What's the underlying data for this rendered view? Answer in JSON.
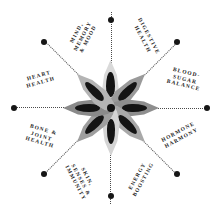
{
  "graphic": {
    "type": "radial-benefit-wheel",
    "title_visible": false,
    "background_color": "#ffffff",
    "center_motif": {
      "name": "eight-petal-flower",
      "petal_count": 8,
      "core_color": "#101010",
      "inner_marking_color": "#141414",
      "petal_colors": [
        "#d9d9d9",
        "#9a9a9a",
        "#8e8e8e",
        "#a8a8a8",
        "#d4d4d4",
        "#9e9e9e",
        "#8a8a8a",
        "#b4b4b4"
      ]
    },
    "connector": {
      "style": "dotted",
      "color": "#2b2b2b",
      "marker": "filled-circle",
      "marker_color": "#161616"
    },
    "categories": [
      {
        "id": "digestive-health",
        "lines": [
          "Digestive",
          "Health"
        ],
        "angle_deg": -45,
        "label_x": 146,
        "label_y": 38,
        "label_rot": 62,
        "dot_x": 178,
        "dot_y": 43
      },
      {
        "id": "blood-sugar-balance",
        "lines": [
          "Blood-",
          "Sugar",
          "Balance"
        ],
        "angle_deg": 0,
        "label_x": 185,
        "label_y": 79,
        "label_rot": 14,
        "dot_x": 208,
        "dot_y": 108
      },
      {
        "id": "hormone-harmony",
        "lines": [
          "Hormone",
          "Harmony"
        ],
        "angle_deg": 45,
        "label_x": 180,
        "label_y": 135,
        "label_rot": -28,
        "dot_x": 178,
        "dot_y": 173
      },
      {
        "id": "energy-boosting",
        "lines": [
          "Energy",
          "Boosting"
        ],
        "angle_deg": 90,
        "label_x": 140,
        "label_y": 178,
        "label_rot": -61,
        "dot_x": 110,
        "dot_y": 196
      },
      {
        "id": "skin-senses-immunity",
        "lines": [
          "Skin,",
          "Senses &",
          "Immunity"
        ],
        "angle_deg": 135,
        "label_x": 81,
        "label_y": 180,
        "label_rot": 62,
        "dot_x": 43
      },
      {
        "id": "bone-joint-health",
        "lines": [
          "Bone &",
          "Joint",
          "Health"
        ],
        "angle_deg": 180,
        "label_x": 42,
        "label_y": 136,
        "label_rot": 16,
        "dot_x": 13,
        "dot_y": 108
      },
      {
        "id": "heart-health",
        "lines": [
          "Heart",
          "Health"
        ],
        "angle_deg": -135,
        "label_x": 40,
        "label_y": 79,
        "label_rot": -16,
        "dot_x": 43,
        "dot_y": 43
      },
      {
        "id": "mind-memory-mood",
        "lines": [
          "Mind,",
          "Memory",
          "& Mood"
        ],
        "angle_deg": -90,
        "label_x": 82,
        "label_y": 36,
        "label_rot": -62,
        "dot_x": 110,
        "dot_y": 20
      }
    ],
    "dots": [
      {
        "id": "dot-digestive-health",
        "x": 177,
        "y": 42
      },
      {
        "id": "dot-blood-sugar-balance",
        "x": 207,
        "y": 108
      },
      {
        "id": "dot-hormone-harmony",
        "x": 177,
        "y": 174
      },
      {
        "id": "dot-energy-boosting",
        "x": 110.5,
        "y": 196
      },
      {
        "id": "dot-skin-senses-immunity",
        "x": 44,
        "y": 174
      },
      {
        "id": "dot-bone-joint-health",
        "x": 14,
        "y": 108
      },
      {
        "id": "dot-heart-health",
        "x": 44,
        "y": 42
      },
      {
        "id": "dot-mind-memory-mood",
        "x": 110.5,
        "y": 20
      }
    ]
  }
}
